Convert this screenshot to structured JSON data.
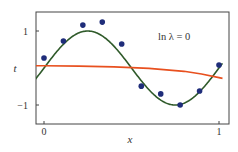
{
  "chart_data": {
    "type": "scatter",
    "title": "",
    "xlabel": "x",
    "ylabel": "t",
    "xlim": [
      -0.05,
      1.02
    ],
    "ylim": [
      -1.5,
      1.5
    ],
    "xticks": [
      0,
      1
    ],
    "xtick_labels": [
      "0",
      "1"
    ],
    "yticks": [
      1,
      -1
    ],
    "ytick_labels": [
      "1",
      "−1"
    ],
    "grid": false,
    "annotation": "ln λ = 0",
    "series": [
      {
        "name": "data points",
        "type": "scatter",
        "color": "#1f2d7a",
        "x": [
          0.0,
          0.111,
          0.222,
          0.333,
          0.444,
          0.556,
          0.667,
          0.778,
          0.889,
          1.0
        ],
        "y": [
          0.27,
          0.73,
          1.16,
          1.24,
          0.65,
          -0.49,
          -0.7,
          -1.0,
          -0.62,
          0.08
        ]
      },
      {
        "name": "sin(2πx)",
        "type": "line",
        "color": "#2f5a2a",
        "function": "sin(2*pi*x)"
      },
      {
        "name": "regularized polynomial fit (M=9, ln λ = 0)",
        "type": "line",
        "color": "#e8501f",
        "x": [
          -0.05,
          0.0,
          0.2,
          0.4,
          0.5,
          0.6,
          0.8,
          0.9,
          1.0,
          1.02
        ],
        "y": [
          0.06,
          0.06,
          0.05,
          0.03,
          0.01,
          -0.01,
          -0.09,
          -0.16,
          -0.26,
          -0.28
        ]
      }
    ]
  }
}
